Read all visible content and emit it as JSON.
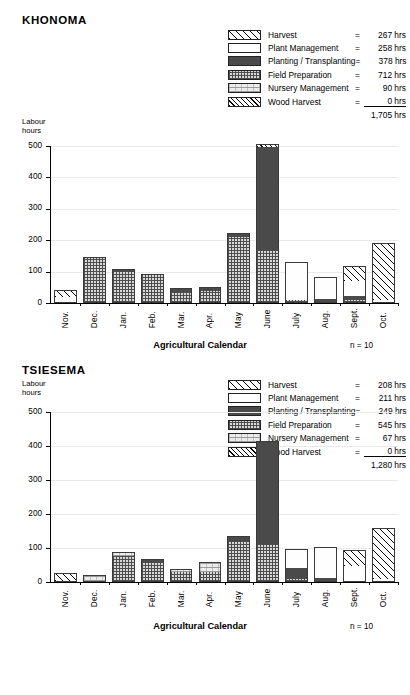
{
  "panels": [
    {
      "title": "KHONOMA",
      "y_axis_label_line1": "Labour",
      "y_axis_label_line2": "hours",
      "x_axis_title": "Agricultural Calendar",
      "sample_note": "n = 10",
      "legend": {
        "rows": [
          {
            "key": "harvest",
            "label": "Harvest",
            "eq": "=",
            "value": "267 hrs",
            "swatch": "harvest-swatch"
          },
          {
            "key": "plant",
            "label": "Plant Management",
            "eq": "=",
            "value": "258 hrs",
            "swatch": "plant-management-swatch"
          },
          {
            "key": "planting",
            "label": "Planting / Transplanting",
            "eq": "=",
            "value": "378 hrs",
            "swatch": "planting-transplanting-swatch"
          },
          {
            "key": "field",
            "label": "Field Preparation",
            "eq": "=",
            "value": "712 hrs",
            "swatch": "field-preparation-swatch"
          },
          {
            "key": "nursery",
            "label": "Nursery Management",
            "eq": "=",
            "value": "90 hrs",
            "swatch": "nursery-management-swatch"
          },
          {
            "key": "wood",
            "label": "Wood Harvest",
            "eq": "=",
            "value": "0 hrs",
            "swatch": "wood-harvest-swatch"
          }
        ],
        "total": "1,705 hrs"
      },
      "chart_data": {
        "type": "bar",
        "title": "KHONOMA",
        "subtitle": "",
        "stacked": true,
        "xlabel": "Agricultural Calendar",
        "ylabel": "Labour hours",
        "ylim": [
          0,
          500
        ],
        "yticks": [
          0,
          100,
          200,
          300,
          400,
          500
        ],
        "grid": true,
        "legend_position": "top-right",
        "annotation": "n = 10",
        "categories": [
          "Nov.",
          "Dec.",
          "Jan.",
          "Feb.",
          "Mar.",
          "Apr.",
          "May",
          "June",
          "July",
          "Aug.",
          "Sept.",
          "Oct."
        ],
        "series": [
          {
            "name": "Field Preparation",
            "values": [
              0,
              140,
              97,
              86,
              32,
              36,
              208,
              165,
              8,
              0,
              6,
              0
            ]
          },
          {
            "name": "Nursery Management",
            "values": [
              0,
              0,
              0,
              0,
              0,
              0,
              0,
              0,
              0,
              0,
              0,
              0
            ]
          },
          {
            "name": "Planting / Transplanting",
            "values": [
              0,
              0,
              6,
              0,
              8,
              9,
              8,
              330,
              0,
              9,
              12,
              0
            ]
          },
          {
            "name": "Plant Management",
            "values": [
              16,
              0,
              0,
              0,
              0,
              0,
              0,
              0,
              115,
              66,
              50,
              8
            ]
          },
          {
            "name": "Harvest",
            "values": [
              20,
              0,
              0,
              0,
              0,
              0,
              0,
              0,
              0,
              0,
              42,
              177
            ]
          },
          {
            "name": "Wood Harvest",
            "values": [
              0,
              0,
              0,
              0,
              0,
              0,
              0,
              5,
              0,
              0,
              0,
              0
            ]
          }
        ],
        "totals": [
          36,
          140,
          103,
          86,
          40,
          45,
          216,
          500,
          123,
          75,
          110,
          185
        ]
      }
    },
    {
      "title": "TSIESEMA",
      "y_axis_label_line1": "Labour",
      "y_axis_label_line2": "hours",
      "x_axis_title": "Agricultural Calendar",
      "sample_note": "n = 10",
      "legend": {
        "rows": [
          {
            "key": "harvest",
            "label": "Harvest",
            "eq": "=",
            "value": "208 hrs",
            "swatch": "harvest-swatch"
          },
          {
            "key": "plant",
            "label": "Plant Management",
            "eq": "=",
            "value": "211 hrs",
            "swatch": "plant-management-swatch"
          },
          {
            "key": "planting",
            "label": "Planting / Transplanting",
            "eq": "=",
            "value": "249 hrs",
            "swatch": "planting-transplanting-swatch"
          },
          {
            "key": "field",
            "label": "Field Preparation",
            "eq": "=",
            "value": "545 hrs",
            "swatch": "field-preparation-swatch"
          },
          {
            "key": "nursery",
            "label": "Nursery Management",
            "eq": "=",
            "value": "67 hrs",
            "swatch": "nursery-management-swatch"
          },
          {
            "key": "wood",
            "label": "Wood Harvest",
            "eq": "=",
            "value": "0 hrs",
            "swatch": "wood-harvest-swatch"
          }
        ],
        "total": "1,280 hrs"
      },
      "chart_data": {
        "type": "bar",
        "title": "TSIESEMA",
        "subtitle": "",
        "stacked": true,
        "xlabel": "Agricultural Calendar",
        "ylabel": "Labour hours",
        "ylim": [
          0,
          500
        ],
        "yticks": [
          0,
          100,
          200,
          300,
          400,
          500
        ],
        "grid": true,
        "legend_position": "top-right",
        "annotation": "n = 10",
        "categories": [
          "Nov.",
          "Dec.",
          "Jan.",
          "Feb.",
          "Mar.",
          "Apr.",
          "May",
          "June",
          "July",
          "Aug.",
          "Sept.",
          "Oct."
        ],
        "series": [
          {
            "name": "Field Preparation",
            "values": [
              0,
              0,
              73,
              54,
              26,
              26,
              115,
              108,
              7,
              0,
              0,
              0
            ]
          },
          {
            "name": "Nursery Management",
            "values": [
              0,
              14,
              9,
              0,
              5,
              28,
              0,
              0,
              0,
              0,
              0,
              0
            ]
          },
          {
            "name": "Planting / Transplanting",
            "values": [
              0,
              0,
              0,
              7,
              0,
              0,
              15,
              300,
              31,
              8,
              0,
              0
            ]
          },
          {
            "name": "Plant Management",
            "values": [
              0,
              0,
              0,
              0,
              0,
              0,
              0,
              0,
              54,
              88,
              43,
              6
            ]
          },
          {
            "name": "Harvest",
            "values": [
              22,
              0,
              0,
              0,
              0,
              0,
              0,
              0,
              0,
              0,
              45,
              147
            ]
          },
          {
            "name": "Wood Harvest",
            "values": [
              0,
              0,
              0,
              0,
              0,
              0,
              0,
              0,
              0,
              0,
              0,
              0
            ]
          }
        ],
        "totals": [
          22,
          14,
          82,
          61,
          31,
          54,
          130,
          408,
          92,
          96,
          88,
          153
        ]
      }
    }
  ]
}
